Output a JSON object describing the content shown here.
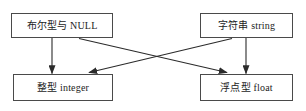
{
  "diagram": {
    "nodes": [
      {
        "id": "bool",
        "label": "布尔型与 NULL",
        "name": "node-boolean-null"
      },
      {
        "id": "str",
        "label": "字符串 string",
        "name": "node-string"
      },
      {
        "id": "int",
        "label": "整型 integer",
        "name": "node-integer"
      },
      {
        "id": "float",
        "label": "浮点型 float",
        "name": "node-float"
      }
    ],
    "edges": [
      {
        "id": "bool-int",
        "from": "bool",
        "to": "int",
        "style": "vertical",
        "arrow": "single"
      },
      {
        "id": "bool-float",
        "from": "bool",
        "to": "float",
        "style": "diagonal",
        "arrow": "single"
      },
      {
        "id": "str-int",
        "from": "str",
        "to": "int",
        "style": "diagonal",
        "arrow": "single"
      },
      {
        "id": "str-float",
        "from": "str",
        "to": "float",
        "style": "vertical",
        "arrow": "single"
      }
    ],
    "colors": {
      "box_border": "#4a4a4a",
      "box_fill": "#ffffff",
      "edge": "#2b2b2b",
      "text": "#1c1c1c",
      "background": "#ffffff"
    }
  }
}
